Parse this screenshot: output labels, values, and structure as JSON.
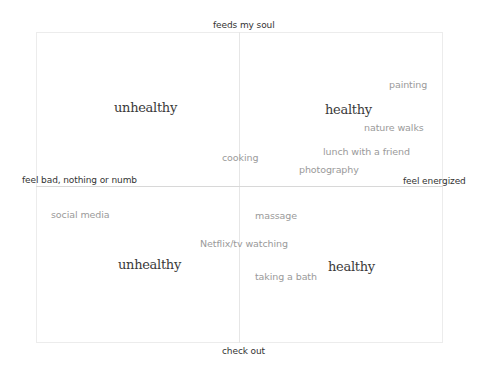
{
  "axes": {
    "top": "feeds my soul",
    "bottom": "check out",
    "left": "feel bad, nothing or numb",
    "right": "feel energized"
  },
  "quadrants": {
    "top_left": "unhealthy",
    "top_right": "healthy",
    "bottom_left": "unhealthy",
    "bottom_right": "healthy"
  },
  "items": [
    {
      "label": "painting"
    },
    {
      "label": "nature walks"
    },
    {
      "label": "cooking"
    },
    {
      "label": "lunch with a friend"
    },
    {
      "label": "photography"
    },
    {
      "label": "social media"
    },
    {
      "label": "massage"
    },
    {
      "label": "Netflix/tv watching"
    },
    {
      "label": "taking a bath"
    }
  ]
}
